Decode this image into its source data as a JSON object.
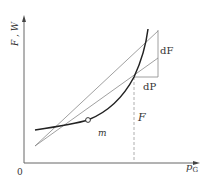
{
  "diagram": {
    "axes": {
      "y_label": "F , W",
      "x_label_main": "p",
      "x_label_sub": "G",
      "origin_label": "0"
    },
    "labels": {
      "dF": "dF",
      "dP": "dP",
      "F": "F",
      "m": "m"
    },
    "colors": {
      "axis": "#555555",
      "curve": "#222222",
      "line": "#777777",
      "text": "#333333"
    }
  }
}
